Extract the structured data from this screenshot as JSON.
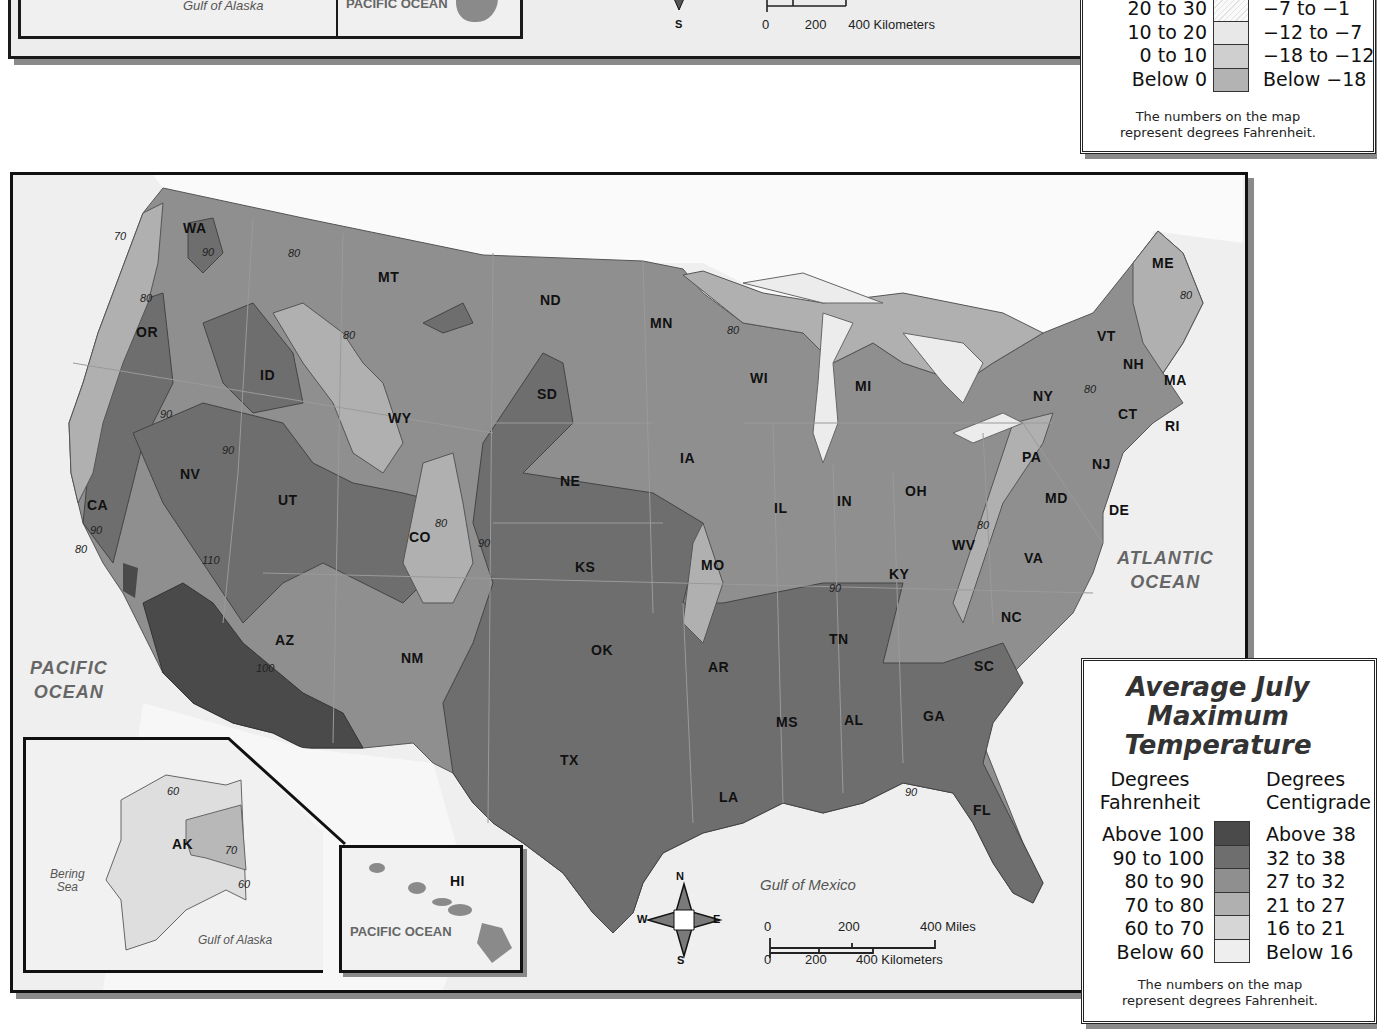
{
  "top_partial": {
    "alaska_label": "Gulf of Alaska",
    "hawaii_label": "PACIFIC OCEAN",
    "compass_s": "S",
    "scale": {
      "km_ticks": [
        "0",
        "200",
        "400 Kilometers"
      ]
    },
    "legend": {
      "rows": [
        {
          "f": "20 to 30",
          "c": "−7 to −1",
          "color": "#f2f2f2",
          "hatched": true
        },
        {
          "f": "10 to 20",
          "c": "−12 to −7",
          "color": "#e6e6e6"
        },
        {
          "f": "0 to 10",
          "c": "−18 to −12",
          "color": "#cfcfcf"
        },
        {
          "f": "Below 0",
          "c": "Below −18",
          "color": "#b3b3b3"
        }
      ],
      "note_line1": "The numbers on the map",
      "note_line2": "represent degrees Fahrenheit."
    }
  },
  "main_map": {
    "states": [
      {
        "abbr": "WA",
        "x": 193,
        "y": 228
      },
      {
        "abbr": "OR",
        "x": 146,
        "y": 332
      },
      {
        "abbr": "CA",
        "x": 97,
        "y": 505
      },
      {
        "abbr": "NV",
        "x": 190,
        "y": 474
      },
      {
        "abbr": "ID",
        "x": 270,
        "y": 375
      },
      {
        "abbr": "MT",
        "x": 388,
        "y": 277
      },
      {
        "abbr": "WY",
        "x": 398,
        "y": 418
      },
      {
        "abbr": "UT",
        "x": 288,
        "y": 500
      },
      {
        "abbr": "AZ",
        "x": 285,
        "y": 640
      },
      {
        "abbr": "CO",
        "x": 419,
        "y": 537
      },
      {
        "abbr": "NM",
        "x": 411,
        "y": 658
      },
      {
        "abbr": "ND",
        "x": 550,
        "y": 300
      },
      {
        "abbr": "SD",
        "x": 547,
        "y": 394
      },
      {
        "abbr": "NE",
        "x": 570,
        "y": 481
      },
      {
        "abbr": "KS",
        "x": 585,
        "y": 567
      },
      {
        "abbr": "OK",
        "x": 601,
        "y": 650
      },
      {
        "abbr": "TX",
        "x": 570,
        "y": 760
      },
      {
        "abbr": "MN",
        "x": 660,
        "y": 323
      },
      {
        "abbr": "IA",
        "x": 690,
        "y": 458
      },
      {
        "abbr": "MO",
        "x": 711,
        "y": 565
      },
      {
        "abbr": "AR",
        "x": 718,
        "y": 667
      },
      {
        "abbr": "LA",
        "x": 729,
        "y": 797
      },
      {
        "abbr": "WI",
        "x": 760,
        "y": 378
      },
      {
        "abbr": "IL",
        "x": 784,
        "y": 508
      },
      {
        "abbr": "MI",
        "x": 865,
        "y": 386
      },
      {
        "abbr": "IN",
        "x": 847,
        "y": 501
      },
      {
        "abbr": "OH",
        "x": 915,
        "y": 491
      },
      {
        "abbr": "KY",
        "x": 899,
        "y": 574
      },
      {
        "abbr": "TN",
        "x": 839,
        "y": 639
      },
      {
        "abbr": "MS",
        "x": 786,
        "y": 722
      },
      {
        "abbr": "AL",
        "x": 854,
        "y": 720
      },
      {
        "abbr": "GA",
        "x": 933,
        "y": 716
      },
      {
        "abbr": "FL",
        "x": 983,
        "y": 810
      },
      {
        "abbr": "SC",
        "x": 984,
        "y": 666
      },
      {
        "abbr": "NC",
        "x": 1011,
        "y": 617
      },
      {
        "abbr": "VA",
        "x": 1034,
        "y": 558
      },
      {
        "abbr": "WV",
        "x": 962,
        "y": 545
      },
      {
        "abbr": "PA",
        "x": 1032,
        "y": 457
      },
      {
        "abbr": "NY",
        "x": 1043,
        "y": 396
      },
      {
        "abbr": "MD",
        "x": 1055,
        "y": 498
      },
      {
        "abbr": "NJ",
        "x": 1102,
        "y": 464
      },
      {
        "abbr": "DE",
        "x": 1119,
        "y": 510
      },
      {
        "abbr": "CT",
        "x": 1128,
        "y": 414
      },
      {
        "abbr": "RI",
        "x": 1175,
        "y": 426
      },
      {
        "abbr": "MA",
        "x": 1174,
        "y": 380
      },
      {
        "abbr": "NH",
        "x": 1133,
        "y": 364
      },
      {
        "abbr": "VT",
        "x": 1107,
        "y": 336
      },
      {
        "abbr": "ME",
        "x": 1162,
        "y": 263
      }
    ],
    "isotherms": [
      {
        "v": "70",
        "x": 120,
        "y": 237
      },
      {
        "v": "90",
        "x": 208,
        "y": 253
      },
      {
        "v": "80",
        "x": 294,
        "y": 254
      },
      {
        "v": "80",
        "x": 146,
        "y": 299
      },
      {
        "v": "80",
        "x": 349,
        "y": 336
      },
      {
        "v": "90",
        "x": 166,
        "y": 415
      },
      {
        "v": "90",
        "x": 228,
        "y": 451
      },
      {
        "v": "90",
        "x": 96,
        "y": 531
      },
      {
        "v": "80",
        "x": 81,
        "y": 550
      },
      {
        "v": "110",
        "x": 208,
        "y": 561
      },
      {
        "v": "100",
        "x": 262,
        "y": 669
      },
      {
        "v": "80",
        "x": 441,
        "y": 524
      },
      {
        "v": "90",
        "x": 484,
        "y": 544
      },
      {
        "v": "80",
        "x": 733,
        "y": 331
      },
      {
        "v": "90",
        "x": 835,
        "y": 589
      },
      {
        "v": "90",
        "x": 911,
        "y": 793
      },
      {
        "v": "80",
        "x": 983,
        "y": 526
      },
      {
        "v": "80",
        "x": 1090,
        "y": 390
      },
      {
        "v": "80",
        "x": 1186,
        "y": 296
      }
    ],
    "oceans": {
      "pacific": [
        "PACIFIC",
        "OCEAN"
      ],
      "atlantic": [
        "ATLANTIC",
        "OCEAN"
      ],
      "gulf_of_mexico": "Gulf of Mexico"
    },
    "alaska_inset": {
      "state": "AK",
      "isotherms": [
        "60",
        "70",
        "60"
      ],
      "bering_sea": [
        "Bering",
        "Sea"
      ],
      "gulf_of_alaska": "Gulf of Alaska"
    },
    "hawaii_inset": {
      "state": "HI",
      "ocean": "PACIFIC OCEAN"
    },
    "compass": {
      "n": "N",
      "s": "S",
      "e": "E",
      "w": "W"
    },
    "scale": {
      "miles_ticks": [
        "0",
        "200",
        "400 Miles"
      ],
      "km_ticks": [
        "0",
        "200",
        "400 Kilometers"
      ]
    }
  },
  "legend": {
    "title_lines": [
      "Average July",
      "Maximum",
      "Temperature"
    ],
    "col_f": [
      "Degrees",
      "Fahrenheit"
    ],
    "col_c": [
      "Degrees",
      "Centigrade"
    ],
    "rows": [
      {
        "f": "Above 100",
        "c": "Above 38",
        "color": "#4a4a4a"
      },
      {
        "f": "90 to 100",
        "c": "32 to 38",
        "color": "#6e6e6e"
      },
      {
        "f": "80 to 90",
        "c": "27 to 32",
        "color": "#8f8f8f"
      },
      {
        "f": "70 to 80",
        "c": "21 to 27",
        "color": "#b0b0b0"
      },
      {
        "f": "60 to 70",
        "c": "16 to 21",
        "color": "#d6d6d6"
      },
      {
        "f": "Below 60",
        "c": "Below 16",
        "color": "#eeeeee"
      }
    ],
    "note_line1": "The numbers on the map",
    "note_line2": "represent degrees Fahrenheit."
  }
}
